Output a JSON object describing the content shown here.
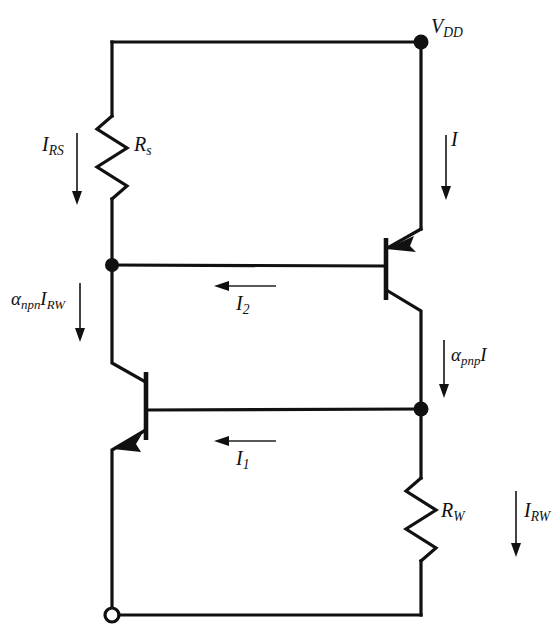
{
  "diagram": {
    "type": "electrical-schematic",
    "stroke_color": "#111111",
    "background_color": "#ffffff"
  },
  "labels": {
    "vdd": {
      "base": "V",
      "sub": "DD"
    },
    "i_rs": {
      "base": "I",
      "sub": "RS"
    },
    "rs": {
      "base": "R",
      "sub": "s"
    },
    "i_supply": {
      "base": "I",
      "sub": ""
    },
    "alpha_npn_irw": {
      "base": "α",
      "sub": "npn",
      "tail_base": "I",
      "tail_sub": "RW"
    },
    "i2": {
      "base": "I",
      "sub": "2"
    },
    "alpha_pnp_i": {
      "base": "α",
      "sub": "pnp",
      "tail_base": "I",
      "tail_sub": ""
    },
    "i1": {
      "base": "I",
      "sub": "1"
    },
    "rw": {
      "base": "R",
      "sub": "W"
    },
    "i_rw": {
      "base": "I",
      "sub": "RW"
    }
  },
  "components": [
    {
      "name": "resistor-rs",
      "kind": "resistor",
      "label": "R_s",
      "orientation": "vertical"
    },
    {
      "name": "resistor-rw",
      "kind": "resistor",
      "label": "R_W",
      "orientation": "vertical"
    },
    {
      "name": "transistor-pnp",
      "kind": "bjt-pnp",
      "label": "pnp"
    },
    {
      "name": "transistor-npn",
      "kind": "bjt-npn",
      "label": "npn"
    },
    {
      "name": "node-vdd",
      "kind": "junction-dot"
    },
    {
      "name": "node-left",
      "kind": "junction-dot"
    },
    {
      "name": "node-right",
      "kind": "junction-dot"
    },
    {
      "name": "terminal-ground",
      "kind": "open-terminal"
    }
  ],
  "currents": [
    {
      "name": "current-irs",
      "label": "I_RS",
      "direction": "down"
    },
    {
      "name": "current-i",
      "label": "I",
      "direction": "down"
    },
    {
      "name": "current-alpha-npn-irw",
      "label": "alpha_npn I_RW",
      "direction": "down"
    },
    {
      "name": "current-i2",
      "label": "I_2",
      "direction": "left"
    },
    {
      "name": "current-alpha-pnp-i",
      "label": "alpha_pnp I",
      "direction": "down"
    },
    {
      "name": "current-i1",
      "label": "I_1",
      "direction": "left"
    },
    {
      "name": "current-irw",
      "label": "I_RW",
      "direction": "down"
    }
  ]
}
